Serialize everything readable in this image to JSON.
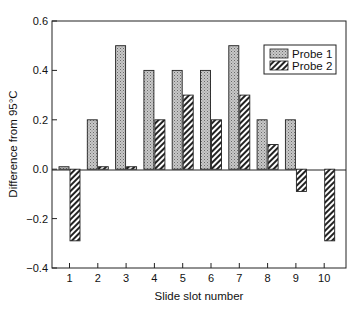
{
  "chart_data": {
    "type": "bar",
    "title": "",
    "xlabel": "Slide slot number",
    "ylabel": "Difference from 95°C",
    "categories": [
      "1",
      "2",
      "3",
      "4",
      "5",
      "6",
      "7",
      "8",
      "9",
      "10"
    ],
    "series": [
      {
        "name": "Probe 1",
        "pattern": "stipple",
        "values": [
          0.01,
          0.2,
          0.5,
          0.4,
          0.4,
          0.4,
          0.5,
          0.2,
          0.2,
          0.0
        ]
      },
      {
        "name": "Probe 2",
        "pattern": "hatch",
        "values": [
          -0.29,
          0.01,
          0.01,
          0.2,
          0.3,
          0.2,
          0.3,
          0.1,
          -0.09,
          -0.29
        ]
      }
    ],
    "ylim": [
      -0.4,
      0.6
    ],
    "yticks": [
      -0.4,
      -0.2,
      0.0,
      0.2,
      0.4,
      0.6
    ],
    "ytick_labels": [
      "−0.4",
      "−0.2",
      "0.0",
      "0.2",
      "0.4",
      "0.6"
    ],
    "grid": false,
    "zero_line": true,
    "legend_position": "upper right"
  },
  "legend": {
    "items": [
      {
        "label": "Probe 1"
      },
      {
        "label": "Probe 2"
      }
    ]
  },
  "axes": {
    "xlabel": "Slide slot number",
    "ylabel": "Difference from 95°C"
  }
}
